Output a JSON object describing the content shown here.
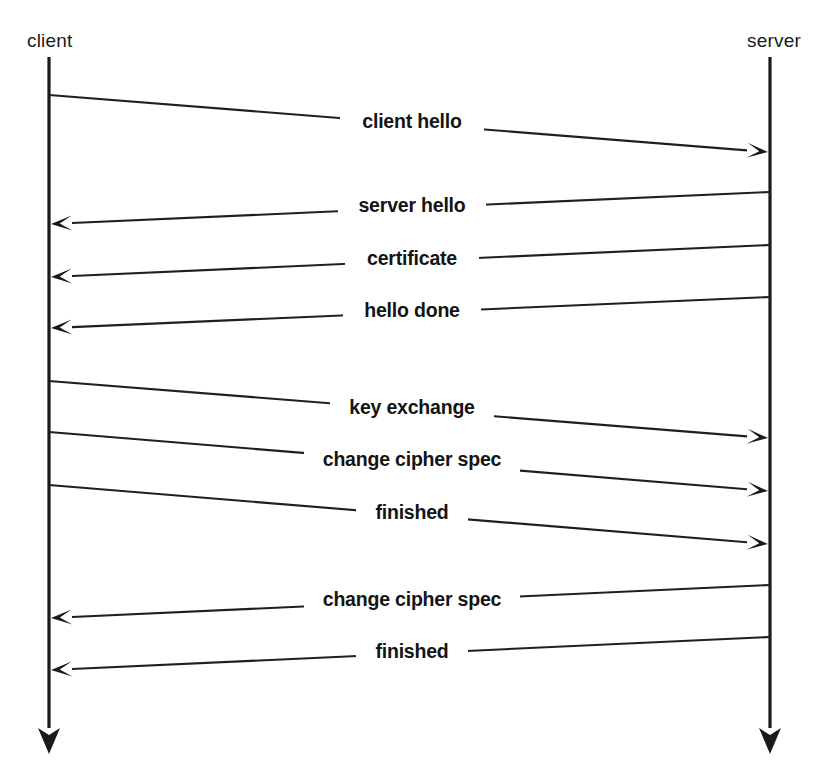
{
  "diagram": {
    "type": "sequence-diagram",
    "width": 821,
    "height": 770,
    "ink_color": "#1a1a1a",
    "background_color": "#ffffff"
  },
  "lifelines": [
    {
      "id": "client",
      "label": "client",
      "x": 49,
      "label_x": 27,
      "label_y": 47,
      "label_anchor": "start",
      "top_y": 57,
      "bottom_y": 728
    },
    {
      "id": "server",
      "label": "server",
      "x": 770,
      "label_x": 747,
      "label_y": 47,
      "label_anchor": "start",
      "top_y": 57,
      "bottom_y": 728
    }
  ],
  "messages": [
    {
      "index": 1,
      "label": "client hello",
      "direction": "right",
      "from": "client",
      "to": "server",
      "start_x": 49,
      "start_y": 95,
      "end_x": 770,
      "end_y": 152,
      "label_x": 412,
      "label_y": 128,
      "label_halfwidth": 62
    },
    {
      "index": 2,
      "label": "server hello",
      "direction": "left",
      "from": "server",
      "to": "client",
      "start_x": 770,
      "start_y": 192,
      "end_x": 49,
      "end_y": 224,
      "label_x": 412,
      "label_y": 212,
      "label_halfwidth": 64
    },
    {
      "index": 3,
      "label": "certificate",
      "direction": "left",
      "from": "server",
      "to": "client",
      "start_x": 770,
      "start_y": 245,
      "end_x": 49,
      "end_y": 277,
      "label_x": 412,
      "label_y": 265,
      "label_halfwidth": 57
    },
    {
      "index": 4,
      "label": "hello done",
      "direction": "left",
      "from": "server",
      "to": "client",
      "start_x": 770,
      "start_y": 297,
      "end_x": 49,
      "end_y": 328,
      "label_x": 412,
      "label_y": 317,
      "label_halfwidth": 59
    },
    {
      "index": 5,
      "label": "key exchange",
      "direction": "right",
      "from": "client",
      "to": "server",
      "start_x": 49,
      "start_y": 381,
      "end_x": 770,
      "end_y": 438,
      "label_x": 412,
      "label_y": 414,
      "label_halfwidth": 72
    },
    {
      "index": 6,
      "label": "change cipher spec",
      "direction": "right",
      "from": "client",
      "to": "server",
      "start_x": 49,
      "start_y": 432,
      "end_x": 770,
      "end_y": 491,
      "label_x": 412,
      "label_y": 466,
      "label_halfwidth": 98
    },
    {
      "index": 7,
      "label": "finished",
      "direction": "right",
      "from": "client",
      "to": "server",
      "start_x": 49,
      "start_y": 485,
      "end_x": 770,
      "end_y": 544,
      "label_x": 412,
      "label_y": 519,
      "label_halfwidth": 46
    },
    {
      "index": 8,
      "label": "change cipher spec",
      "direction": "left",
      "from": "server",
      "to": "client",
      "start_x": 770,
      "start_y": 585,
      "end_x": 49,
      "end_y": 618,
      "label_x": 412,
      "label_y": 606,
      "label_halfwidth": 98
    },
    {
      "index": 9,
      "label": "finished",
      "direction": "left",
      "from": "server",
      "to": "client",
      "start_x": 770,
      "start_y": 637,
      "end_x": 49,
      "end_y": 670,
      "label_x": 412,
      "label_y": 658,
      "label_halfwidth": 46
    }
  ]
}
